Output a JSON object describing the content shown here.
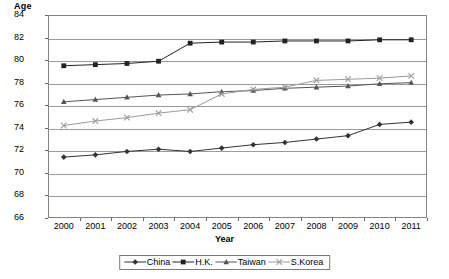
{
  "chart_data": {
    "type": "line",
    "title": "",
    "xlabel": "Year",
    "ylabel": "Age",
    "categories": [
      "2000",
      "2001",
      "2002",
      "2003",
      "2004",
      "2005",
      "2006",
      "2007",
      "2008",
      "2009",
      "2010",
      "2011"
    ],
    "x": [
      2000,
      2001,
      2002,
      2003,
      2004,
      2005,
      2006,
      2007,
      2008,
      2009,
      2010,
      2011
    ],
    "ylim": [
      66,
      84
    ],
    "yticks": [
      66,
      68,
      70,
      72,
      74,
      76,
      78,
      80,
      82,
      84
    ],
    "grid": true,
    "legend_position": "bottom",
    "series": [
      {
        "name": "China",
        "marker": "diamond",
        "color": "#333333",
        "values": [
          71.4,
          71.6,
          71.9,
          72.1,
          71.9,
          72.2,
          72.5,
          72.7,
          73.0,
          73.3,
          74.3,
          74.5
        ]
      },
      {
        "name": "H.K.",
        "marker": "square",
        "color": "#222222",
        "values": [
          79.5,
          79.6,
          79.7,
          79.9,
          81.5,
          81.6,
          81.6,
          81.7,
          81.7,
          81.7,
          81.8,
          81.8
        ]
      },
      {
        "name": "Taiwan",
        "marker": "triangle",
        "color": "#555555",
        "values": [
          76.3,
          76.5,
          76.7,
          76.9,
          77.0,
          77.2,
          77.3,
          77.5,
          77.6,
          77.7,
          77.9,
          78.0
        ]
      },
      {
        "name": "S.Korea",
        "marker": "cross",
        "color": "#9a9a9a",
        "values": [
          74.2,
          74.6,
          74.9,
          75.3,
          75.6,
          77.0,
          77.4,
          77.6,
          78.2,
          78.3,
          78.4,
          78.6
        ]
      }
    ]
  },
  "axes": {
    "y_title": "Age",
    "x_title": "Year",
    "y_tick_labels": [
      "84",
      "82",
      "80",
      "78",
      "76",
      "74",
      "72",
      "70",
      "68",
      "66"
    ],
    "x_tick_labels": [
      "2000",
      "2001",
      "2002",
      "2003",
      "2004",
      "2005",
      "2006",
      "2007",
      "2008",
      "2009",
      "2010",
      "2011"
    ]
  },
  "legend": {
    "items": [
      {
        "label": "China",
        "marker": "diamond",
        "color": "#333333"
      },
      {
        "label": "H.K.",
        "marker": "square",
        "color": "#222222"
      },
      {
        "label": "Taiwan",
        "marker": "triangle",
        "color": "#555555"
      },
      {
        "label": "S.Korea",
        "marker": "cross",
        "color": "#9a9a9a"
      }
    ]
  },
  "colors": {
    "grid": "#9a9a9a",
    "frame": "#848484",
    "background": "#ffffff",
    "text": "#000000"
  }
}
